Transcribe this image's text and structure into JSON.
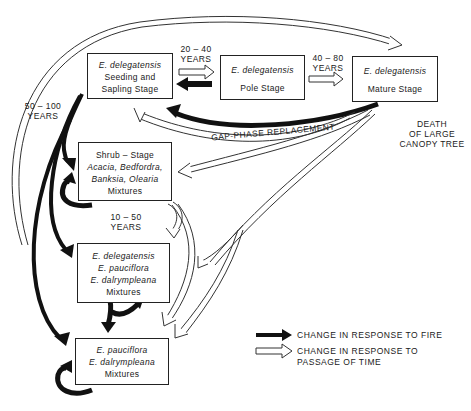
{
  "boxes": {
    "seedling": {
      "species": "E. delegatensis",
      "line1": "Seeding and",
      "line2": "Sapling Stage"
    },
    "pole": {
      "species": "E. delegatensis",
      "line1": "Pole Stage"
    },
    "mature": {
      "species": "E. delegatensis",
      "line1": "Mature Stage"
    },
    "shrub": {
      "line1": "Shrub – Stage",
      "species1": "Acacia, Bedfordra,",
      "species2": "Banksia, Olearia",
      "line2": "Mixtures"
    },
    "mix1": {
      "species1": "E. delegatensis",
      "species2": "E. pauciflora",
      "species3": "E. dalrympleana",
      "line1": "Mixtures"
    },
    "mix2": {
      "species1": "E. pauciflora",
      "species2": "E. dalrympleana",
      "line1": "Mixtures"
    }
  },
  "labels": {
    "y20_40_a": "20 – 40",
    "y20_40_b": "YEARS",
    "y40_80_a": "40 – 80",
    "y40_80_b": "YEARS",
    "y50_100_a": "50 – 100",
    "y50_100_b": "YEARS",
    "y10_50_a": "10 – 50",
    "y10_50_b": "YEARS",
    "gap_phase": "GAP-PHASE REPLACEMENT",
    "death1": "DEATH",
    "death2": "OF LARGE",
    "death3": "CANOPY TREE"
  },
  "legend": {
    "fire": "CHANGE IN RESPONSE TO FIRE",
    "time1": "CHANGE IN RESPONSE TO",
    "time2": "PASSAGE OF TIME"
  },
  "colors": {
    "fire_arrow": "#111111",
    "time_arrow_outline": "#333333",
    "background": "#ffffff"
  }
}
